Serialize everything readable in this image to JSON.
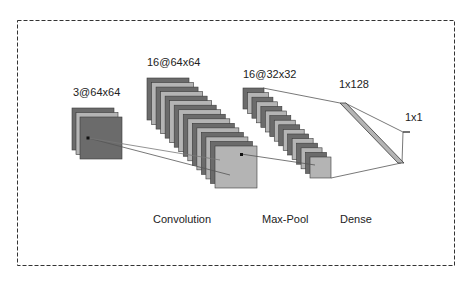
{
  "diagram": {
    "type": "cnn-architecture",
    "colors": {
      "dark": "#6b6b6b",
      "light": "#b4b4b4",
      "edge": "#3a3a3a",
      "connector": "#555555",
      "border": "#333333"
    },
    "layers": [
      {
        "id": "input",
        "shape_label": "3@64x64",
        "type_label": ""
      },
      {
        "id": "conv",
        "shape_label": "16@64x64",
        "type_label": "Convolution"
      },
      {
        "id": "pool",
        "shape_label": "16@32x32",
        "type_label": "Max-Pool"
      },
      {
        "id": "dense",
        "shape_label": "1x128",
        "type_label": "Dense"
      },
      {
        "id": "output",
        "shape_label": "1x1",
        "type_label": ""
      }
    ]
  }
}
